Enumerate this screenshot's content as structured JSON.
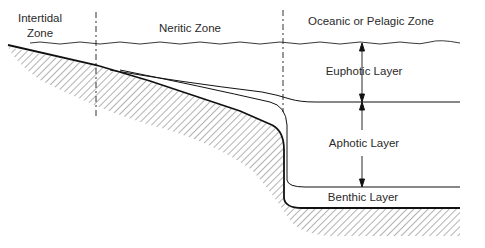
{
  "diagram": {
    "zones": [
      {
        "label_line1": "Intertidal",
        "label_line2": "Zone"
      },
      {
        "label": "Neritic Zone"
      },
      {
        "label": "Oceanic or Pelagic Zone"
      }
    ],
    "layers": [
      {
        "label": "Euphotic Layer"
      },
      {
        "label": "Aphotic Layer"
      },
      {
        "label": "Benthic Layer"
      }
    ],
    "colors": {
      "line": "#1a1a1a",
      "hatch": "#555555",
      "background": "#ffffff"
    }
  }
}
